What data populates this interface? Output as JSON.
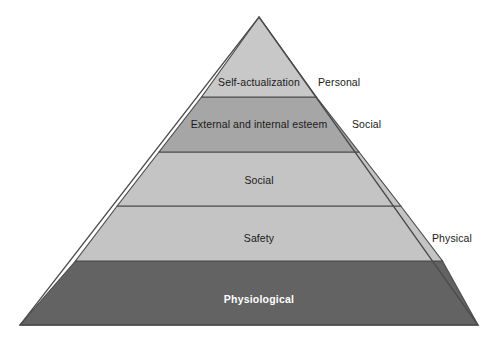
{
  "figure": {
    "name": "needs-hierarchy-pyramid",
    "background_color": "#ffffff",
    "outline_color": "#4a4a4a",
    "geometry": {
      "apex_x": 259,
      "apex_y": 17,
      "base_left_x": 20,
      "base_right_x": 478,
      "base_y": 325,
      "divider_y": [
        97,
        152,
        206,
        261
      ]
    }
  },
  "tiers": [
    {
      "label": "Self-actualization",
      "color": "#c8c8c8",
      "text_color": "#1a1a1a",
      "bold": false,
      "center_x": 259,
      "center_y": 82
    },
    {
      "label": "External and internal esteem",
      "color": "#a6a6a6",
      "text_color": "#1a1a1a",
      "bold": false,
      "center_x": 259,
      "center_y": 124
    },
    {
      "label": "Social",
      "color": "#c4c4c4",
      "text_color": "#1a1a1a",
      "bold": false,
      "center_x": 259,
      "center_y": 180
    },
    {
      "label": "Safety",
      "color": "#c4c4c4",
      "text_color": "#1a1a1a",
      "bold": false,
      "center_x": 259,
      "center_y": 238
    },
    {
      "label": "Physiological",
      "color": "#636363",
      "text_color": "#ffffff",
      "bold": true,
      "center_x": 259,
      "center_y": 299
    }
  ],
  "side_labels": [
    {
      "label": "Personal",
      "x": 318,
      "y": 82
    },
    {
      "label": "Social",
      "x": 352,
      "y": 124
    },
    {
      "label": "Physical",
      "x": 432,
      "y": 238
    }
  ]
}
